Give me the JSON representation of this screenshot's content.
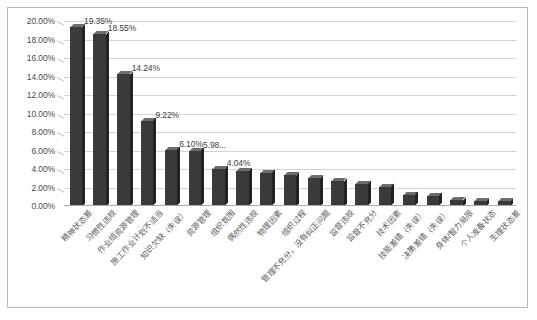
{
  "chart_data": {
    "type": "bar",
    "title": "",
    "xlabel": "",
    "ylabel": "",
    "ylim": [
      0,
      0.2
    ],
    "grid": true,
    "legend": "none",
    "y_tick_labels": [
      "20.00%",
      "18.00%",
      "16.00%",
      "14.00%",
      "12.00%",
      "10.00%",
      "8.00%",
      "6.00%",
      "4.00%",
      "2.00%",
      "0.00%"
    ],
    "y_tick_values": [
      0.2,
      0.18,
      0.16,
      0.14,
      0.12,
      0.1,
      0.08,
      0.06,
      0.04,
      0.02,
      0.0
    ],
    "categories": [
      "精神状态差",
      "习惯性违规",
      "作业组资源管理",
      "施工作业计划不适当",
      "知识欠缺（失误）",
      "资源管理",
      "组织氛围",
      "偶然性违规",
      "物理因素",
      "组织过程",
      "管理不充分，没有纠正问题",
      "监督违规",
      "监督不充分",
      "技术因素",
      "技能差错（失误）",
      "决策差错（失误）",
      "身体/智力局限",
      "个人准备状态",
      "生理状态差"
    ],
    "values": [
      0.1935,
      0.1855,
      0.1424,
      0.0922,
      0.061,
      0.0598,
      0.0404,
      0.038,
      0.036,
      0.033,
      0.03,
      0.027,
      0.024,
      0.021,
      0.012,
      0.011,
      0.006,
      0.005,
      0.005
    ],
    "data_labels": [
      "19.35%",
      "18.55%",
      "14.24%",
      "9.22%",
      "6.10%",
      "5.98...",
      "4.04%",
      "",
      "",
      "",
      "",
      "",
      "",
      "",
      "",
      "",
      "",
      "",
      ""
    ],
    "bar_color": "#3a3a3a",
    "grid_color": "#d4d4d4",
    "axis_color": "#a9a9a9"
  }
}
